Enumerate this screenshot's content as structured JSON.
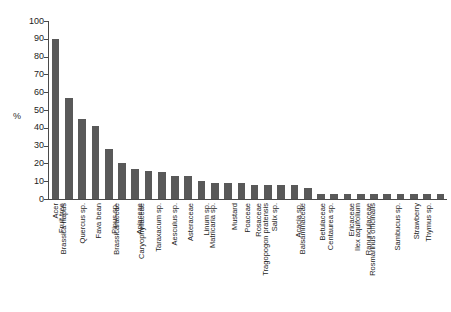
{
  "chart_data": {
    "type": "bar",
    "title": "",
    "xlabel": "",
    "ylabel": "%",
    "ylim": [
      0,
      100
    ],
    "ytick_step": 10,
    "grid": false,
    "legend": "none",
    "bar_color": "#595959",
    "axis_color": "#4a4a4a",
    "background": "#ffffff",
    "ytick_labels": [
      "100",
      "90",
      "80",
      "70",
      "60",
      "50",
      "40",
      "30",
      "20",
      "10",
      "0"
    ],
    "ytick_values": [
      100,
      90,
      80,
      70,
      60,
      50,
      40,
      30,
      20,
      10,
      0
    ],
    "categories": [
      "Acer",
      "Fruit tree",
      "Brassica napus",
      "Quercus sp.",
      "Fava bean",
      "Pinus sp.",
      "Brassicaraceae",
      "Apiaceae",
      "Caryophyllaceae",
      "Taraxacum sp.",
      "Aesculus sp.",
      "Asteraceae",
      "Linum sp.",
      "Matricaria sp.",
      "Mustard",
      "Poaceae",
      "Rosaceae",
      "Salix sp.",
      "Tragopogon pratensis",
      "Acacia sp.",
      "Balsaminaceae",
      "Betulaceae",
      "Centaurea sp.",
      "Ericaceae",
      "Ilex aquifolium",
      "Ranunculaceae",
      "Rosmarinus officinalis",
      "Sambucus sp.",
      "Strawberry",
      "Thymus sp."
    ],
    "values": [
      90,
      57,
      45,
      41,
      28,
      20,
      17,
      16,
      15,
      13,
      13,
      10,
      9,
      9,
      9,
      8,
      8,
      8,
      8,
      6,
      3,
      3,
      3,
      3,
      3,
      3,
      3,
      3,
      3,
      3
    ]
  }
}
